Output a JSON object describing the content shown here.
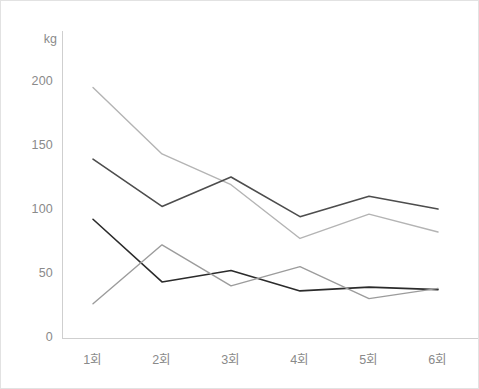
{
  "chart_data": {
    "type": "line",
    "title": "",
    "subtitle": "",
    "xlabel": "",
    "ylabel": "kg",
    "unit_label": "kg",
    "categories": [
      "1회",
      "2회",
      "3회",
      "4회",
      "5회",
      "6회"
    ],
    "x_tick_labels": [
      "1회",
      "2회",
      "3회",
      "4회",
      "5회",
      "6회"
    ],
    "y_tick_labels": [
      "0",
      "50",
      "100",
      "150",
      "200"
    ],
    "y_ticks": [
      0,
      50,
      100,
      150,
      200
    ],
    "ylim": [
      0,
      215
    ],
    "grid": false,
    "legend": "none",
    "axis_color": "#cfcfcf",
    "tick_text_color": "#8a8a8a",
    "background": "#ffffff",
    "border_color": "#e2e2e2",
    "clipped_right_edge": true,
    "series": [
      {
        "name": "series-1-light-gray",
        "color": "#b4b4b4",
        "width": 1.4,
        "values": [
          195,
          143,
          119,
          77,
          96,
          82
        ]
      },
      {
        "name": "series-2-dark-gray",
        "color": "#4d4d4d",
        "width": 1.6,
        "values": [
          139,
          102,
          125,
          94,
          110,
          100
        ]
      },
      {
        "name": "series-3-black",
        "color": "#2b2b2b",
        "width": 1.6,
        "values": [
          92,
          43,
          52,
          36,
          39,
          37
        ]
      },
      {
        "name": "series-4-mid-gray",
        "color": "#9c9c9c",
        "width": 1.4,
        "values": [
          26,
          72,
          40,
          55,
          30,
          38
        ]
      }
    ]
  },
  "layout": {
    "plot_left": 61,
    "plot_right": 479,
    "plot_top": 30,
    "plot_bottom": 337,
    "y_zero_px": 336,
    "y_200_px": 80,
    "x_first_px": 92,
    "x_step_px": 69,
    "unit_label_x": 56,
    "unit_label_y": 38,
    "y_label_right_x": 52,
    "x_label_y": 348
  }
}
